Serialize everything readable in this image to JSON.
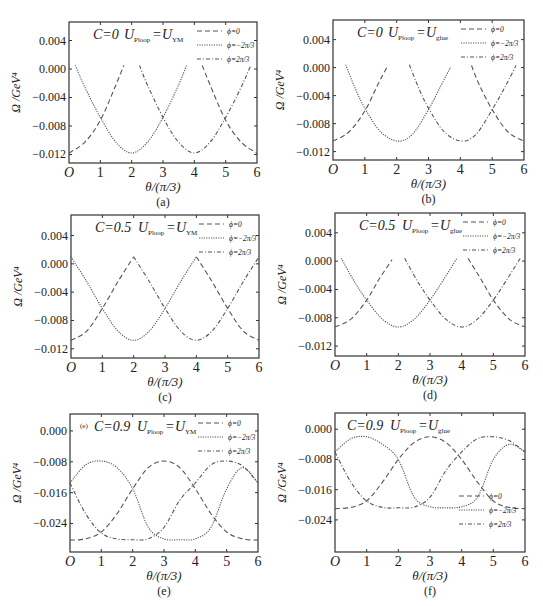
{
  "figure": {
    "shared": {
      "xlabel": "θ/(π/3)",
      "ylabel": "Ω /GeV⁴",
      "x_tick_labels": [
        "O",
        "1",
        "2",
        "3",
        "4",
        "5",
        "6"
      ],
      "legend": [
        {
          "label": "ϕ=0",
          "style": "dashed"
        },
        {
          "label": "ϕ=−2π/3",
          "style": "dotted"
        },
        {
          "label": "ϕ=2π/3",
          "style": "dash-dot"
        }
      ],
      "line_color": "#555555",
      "frame_color": "#333333"
    }
  },
  "chart_data": [
    {
      "panel": "(a)",
      "type": "line",
      "annotation": {
        "C": "C=0",
        "U_left": "U",
        "U_left_sub": "Ploop",
        "eq": "=",
        "U_right": "U",
        "U_right_sub": "YM"
      },
      "xlabel": "θ/(π/3)",
      "ylabel": "Ω /GeV⁴",
      "xlim": [
        0,
        6
      ],
      "ylim": [
        -0.0132,
        0.0066
      ],
      "yticks": [
        0.004,
        0.0,
        -0.004,
        -0.008,
        -0.012
      ],
      "ytick_labels": [
        "0.004",
        "0.000",
        "−0.004",
        "−0.008",
        "−0.012"
      ],
      "legend_position": "top-right",
      "series": [
        {
          "name": "ϕ=0",
          "style": "dashed",
          "segments": [
            {
              "x": [
                0,
                0.5,
                1,
                1.5,
                1.75
              ],
              "y": [
                -0.0118,
                -0.0103,
                -0.0072,
                -0.0022,
                0.0005
              ]
            },
            {
              "x": [
                4.25,
                4.5,
                5,
                5.5,
                6
              ],
              "y": [
                0.0005,
                -0.0022,
                -0.0072,
                -0.0103,
                -0.0118
              ]
            }
          ]
        },
        {
          "name": "ϕ=−2π/3",
          "style": "dotted",
          "segments": [
            {
              "x": [
                0.2,
                0.5,
                1,
                1.5,
                2,
                2.5,
                3,
                3.5,
                3.75
              ],
              "y": [
                0.0005,
                -0.0025,
                -0.0068,
                -0.0103,
                -0.0118,
                -0.0103,
                -0.0068,
                -0.0022,
                0.0005
              ]
            }
          ]
        },
        {
          "name": "ϕ=2π/3",
          "style": "dash-dot",
          "segments": [
            {
              "x": [
                2.25,
                2.5,
                3,
                3.5,
                4,
                4.5,
                5,
                5.5,
                5.8
              ],
              "y": [
                0.0005,
                -0.0022,
                -0.0068,
                -0.0103,
                -0.0118,
                -0.0103,
                -0.0068,
                -0.0025,
                0.0005
              ]
            }
          ]
        }
      ],
      "caption": "(a)"
    },
    {
      "panel": "(b)",
      "type": "line",
      "annotation": {
        "C": "C=0",
        "U_left": "U",
        "U_left_sub": "Ploop",
        "eq": "=",
        "U_right": "U",
        "U_right_sub": "glue"
      },
      "xlabel": "θ/(π/3)",
      "ylabel": "Ω /GeV⁴",
      "xlim": [
        0,
        6
      ],
      "ylim": [
        -0.0132,
        0.0068
      ],
      "yticks": [
        0.004,
        0.0,
        -0.004,
        -0.008,
        -0.012
      ],
      "ytick_labels": [
        "0.004",
        "0.000",
        "−0.004",
        "−0.008",
        "−0.012"
      ],
      "legend_position": "top-right",
      "series": [
        {
          "name": "ϕ=0",
          "style": "dashed",
          "segments": [
            {
              "x": [
                0,
                0.5,
                1,
                1.4,
                1.7
              ],
              "y": [
                -0.0105,
                -0.0092,
                -0.0062,
                -0.0025,
                0.0001
              ]
            },
            {
              "x": [
                4.35,
                4.6,
                5,
                5.5,
                6
              ],
              "y": [
                0.0003,
                -0.0025,
                -0.006,
                -0.0092,
                -0.0105
              ]
            }
          ]
        },
        {
          "name": "ϕ=−2π/3",
          "style": "dotted",
          "segments": [
            {
              "x": [
                0.4,
                0.7,
                1,
                1.5,
                2.05,
                2.5,
                3,
                3.4,
                3.7
              ],
              "y": [
                0.0004,
                -0.003,
                -0.0058,
                -0.0092,
                -0.0105,
                -0.0095,
                -0.006,
                -0.0025,
                0.0001
              ]
            }
          ]
        },
        {
          "name": "ϕ=2π/3",
          "style": "dash-dot",
          "segments": [
            {
              "x": [
                2.4,
                2.7,
                3,
                3.5,
                4.05,
                4.5,
                5,
                5.4,
                5.75
              ],
              "y": [
                0.0004,
                -0.003,
                -0.0058,
                -0.0092,
                -0.0105,
                -0.0095,
                -0.006,
                -0.0028,
                0.0003
              ]
            }
          ]
        }
      ],
      "caption": "(b)"
    },
    {
      "panel": "(c)",
      "type": "line",
      "annotation": {
        "C": "C=0.5",
        "U_left": "U",
        "U_left_sub": "Ploop",
        "eq": "=",
        "U_right": "U",
        "U_right_sub": "YM"
      },
      "xlabel": "θ/(π/3)",
      "ylabel": "Ω /GeV⁴",
      "xlim": [
        0,
        6
      ],
      "ylim": [
        -0.0133,
        0.0069
      ],
      "yticks": [
        0.004,
        0.0,
        -0.004,
        -0.008,
        -0.012
      ],
      "ytick_labels": [
        "0.004",
        "0.000",
        "−0.004",
        "−0.008",
        "−0.012"
      ],
      "legend_position": "top-right",
      "series": [
        {
          "name": "ϕ=0",
          "style": "dashed",
          "segments": [
            {
              "x": [
                0,
                0.5,
                1,
                1.5,
                2
              ],
              "y": [
                -0.0108,
                -0.0095,
                -0.0063,
                -0.0025,
                0.001
              ]
            },
            {
              "x": [
                4,
                4.5,
                5,
                5.5,
                6
              ],
              "y": [
                0.001,
                -0.0025,
                -0.0063,
                -0.0095,
                -0.0108
              ]
            }
          ]
        },
        {
          "name": "ϕ=−2π/3",
          "style": "dotted",
          "segments": [
            {
              "x": [
                0,
                0.5,
                1,
                1.5,
                2,
                2.5,
                3,
                3.5,
                4
              ],
              "y": [
                0.001,
                -0.0025,
                -0.0063,
                -0.0095,
                -0.0108,
                -0.0095,
                -0.0063,
                -0.0025,
                0.001
              ]
            }
          ]
        },
        {
          "name": "ϕ=2π/3",
          "style": "dash-dot",
          "segments": [
            {
              "x": [
                2,
                2.5,
                3,
                3.5,
                4,
                4.5,
                5,
                5.5,
                6
              ],
              "y": [
                0.001,
                -0.0025,
                -0.0063,
                -0.0095,
                -0.0108,
                -0.0095,
                -0.0063,
                -0.0025,
                0.001
              ]
            }
          ]
        }
      ],
      "caption": "(c)"
    },
    {
      "panel": "(d)",
      "type": "line",
      "annotation": {
        "C": "C=0.5",
        "U_left": "U",
        "U_left_sub": "Ploop",
        "eq": "=",
        "U_right": "U",
        "U_right_sub": "glue"
      },
      "xlabel": "θ/(π/3)",
      "ylabel": "Ω /GeV⁴",
      "xlim": [
        0,
        6
      ],
      "ylim": [
        -0.0134,
        0.0068
      ],
      "yticks": [
        0.004,
        0.0,
        -0.004,
        -0.008,
        -0.012
      ],
      "ytick_labels": [
        "0.004",
        "0.000",
        "−0.004",
        "−0.008",
        "−0.012"
      ],
      "legend_position": "top-right",
      "series": [
        {
          "name": "ϕ=0",
          "style": "dashed",
          "segments": [
            {
              "x": [
                0,
                0.5,
                1,
                1.4,
                1.8
              ],
              "y": [
                -0.0093,
                -0.0082,
                -0.0055,
                -0.0025,
                0.0002
              ]
            },
            {
              "x": [
                4.2,
                4.6,
                5,
                5.5,
                6
              ],
              "y": [
                0.0004,
                -0.0025,
                -0.0055,
                -0.0082,
                -0.0093
              ]
            }
          ]
        },
        {
          "name": "ϕ=−2π/3",
          "style": "dotted",
          "segments": [
            {
              "x": [
                0.2,
                0.6,
                1,
                1.5,
                2,
                2.5,
                3,
                3.4,
                3.85
              ],
              "y": [
                0.0004,
                -0.0028,
                -0.0055,
                -0.0082,
                -0.0093,
                -0.0082,
                -0.0055,
                -0.0028,
                0.0004
              ]
            }
          ]
        },
        {
          "name": "ϕ=2π/3",
          "style": "dash-dot",
          "segments": [
            {
              "x": [
                2.2,
                2.6,
                3,
                3.5,
                4,
                4.5,
                5,
                5.4,
                5.85
              ],
              "y": [
                0.0004,
                -0.0028,
                -0.0055,
                -0.0082,
                -0.0093,
                -0.0082,
                -0.0055,
                -0.0028,
                0.0004
              ]
            }
          ]
        }
      ],
      "caption": "(d)"
    },
    {
      "panel": "(e)",
      "type": "line",
      "annotation": {
        "C": "C=0.9",
        "U_left": "U",
        "U_left_sub": "Ploop",
        "eq": "=",
        "U_right": "U",
        "U_right_sub": "YM",
        "inner_tag": "(e)"
      },
      "xlabel": "θ/(π/3)",
      "ylabel": "Ω /GeV⁴",
      "xlim": [
        0,
        6
      ],
      "ylim": [
        -0.0314,
        0.0044
      ],
      "yticks": [
        0.0,
        -0.008,
        -0.016,
        -0.024
      ],
      "ytick_labels": [
        "0.000",
        "−0.008",
        "−0.016",
        "−0.024"
      ],
      "legend_position": "top-right",
      "series": [
        {
          "name": "ϕ=0",
          "style": "dashed",
          "segments": [
            {
              "x": [
                0,
                0.5,
                1,
                1.5,
                2,
                2.5,
                3,
                3.5,
                4,
                4.5,
                5,
                5.5,
                6
              ],
              "y": [
                -0.0283,
                -0.028,
                -0.0262,
                -0.0215,
                -0.015,
                -0.0095,
                -0.0078,
                -0.0095,
                -0.015,
                -0.0215,
                -0.0262,
                -0.028,
                -0.0283
              ]
            }
          ]
        },
        {
          "name": "ϕ=−2π/3",
          "style": "dotted",
          "segments": [
            {
              "x": [
                0,
                0.5,
                1,
                1.5,
                2,
                2.5,
                3,
                3.5,
                4,
                4.5,
                5,
                5.5,
                6
              ],
              "y": [
                -0.0135,
                -0.0088,
                -0.0078,
                -0.0095,
                -0.015,
                -0.025,
                -0.028,
                -0.0282,
                -0.028,
                -0.025,
                -0.015,
                -0.0095,
                -0.0135
              ]
            }
          ]
        },
        {
          "name": "ϕ=2π/3",
          "style": "dash-dot",
          "segments": [
            {
              "x": [
                0,
                0.5,
                1,
                1.5,
                2,
                2.5,
                3,
                3.5,
                4,
                4.5,
                5,
                5.5,
                6
              ],
              "y": [
                -0.0135,
                -0.0215,
                -0.0265,
                -0.028,
                -0.0282,
                -0.028,
                -0.025,
                -0.018,
                -0.0135,
                -0.0088,
                -0.0078,
                -0.009,
                -0.0135
              ]
            }
          ]
        }
      ],
      "caption": "(e)"
    },
    {
      "panel": "(f)",
      "type": "line",
      "annotation": {
        "C": "C=0.9",
        "U_left": "U",
        "U_left_sub": "Ploop",
        "eq": "=",
        "U_right": "U",
        "U_right_sub": "glue"
      },
      "xlabel": "θ/(π/3)",
      "ylabel": "Ω /GeV⁴",
      "xlim": [
        0,
        6
      ],
      "ylim": [
        -0.0325,
        0.0043
      ],
      "yticks": [
        0.0,
        -0.008,
        -0.016,
        -0.024
      ],
      "ytick_labels": [
        "0.000",
        "−0.008",
        "−0.016",
        "−0.024"
      ],
      "legend_position": "bottom-right",
      "series": [
        {
          "name": "ϕ=0",
          "style": "dashed",
          "segments": [
            {
              "x": [
                0,
                0.5,
                1,
                1.5,
                2,
                2.5,
                3,
                3.5,
                4,
                4.5,
                5,
                5.5,
                6
              ],
              "y": [
                -0.021,
                -0.0207,
                -0.019,
                -0.014,
                -0.008,
                -0.0035,
                -0.002,
                -0.0035,
                -0.008,
                -0.014,
                -0.019,
                -0.0207,
                -0.021
              ]
            }
          ]
        },
        {
          "name": "ϕ=−2π/3",
          "style": "dotted",
          "segments": [
            {
              "x": [
                0,
                0.5,
                1,
                1.5,
                2,
                2.5,
                3,
                3.5,
                4,
                4.5,
                5,
                5.5,
                6
              ],
              "y": [
                -0.006,
                -0.0025,
                -0.002,
                -0.004,
                -0.008,
                -0.018,
                -0.0205,
                -0.0208,
                -0.0205,
                -0.018,
                -0.008,
                -0.004,
                -0.006
              ]
            }
          ]
        },
        {
          "name": "ϕ=2π/3",
          "style": "dash-dot",
          "segments": [
            {
              "x": [
                0,
                0.5,
                1,
                1.5,
                2,
                2.5,
                3,
                3.5,
                4,
                4.5,
                5,
                5.5,
                6
              ],
              "y": [
                -0.006,
                -0.014,
                -0.019,
                -0.0207,
                -0.0208,
                -0.0206,
                -0.018,
                -0.011,
                -0.006,
                -0.0025,
                -0.002,
                -0.003,
                -0.006
              ]
            }
          ]
        }
      ],
      "caption": "(f)"
    }
  ]
}
